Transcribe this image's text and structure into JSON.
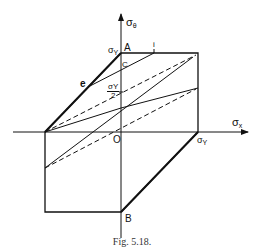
{
  "figure": {
    "caption": "Fig. 5.18.",
    "axes": {
      "vertical_label_symbol": "σ",
      "vertical_label_sub": "θ",
      "horizontal_label_symbol": "σ",
      "horizontal_label_sub": "x"
    },
    "points": {
      "A": "A",
      "B": "B",
      "C": "C",
      "O": "O",
      "e": "e",
      "i": "i"
    },
    "values": {
      "sigma_y_top_symbol": "σ",
      "sigma_y_top_sub": "Y",
      "sigma_y_right_symbol": "σ",
      "sigma_y_right_sub": "Y",
      "half_num": "σY",
      "half_den": "2"
    },
    "colors": {
      "stroke": "#111111",
      "background": "#ffffff"
    }
  }
}
